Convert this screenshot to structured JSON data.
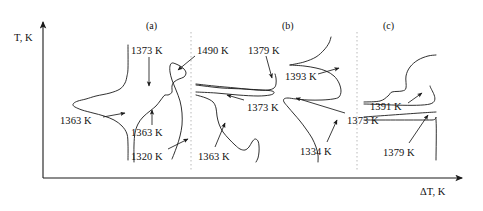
{
  "figure": {
    "background": "#ffffff",
    "ink_color": "#1a1a1a",
    "divider_color": "#b9b9b9",
    "width": 483,
    "height": 211
  },
  "axes": {
    "y_label": "T, K",
    "x_label": "ΔT, K",
    "origin": {
      "x": 43,
      "y": 178
    },
    "y_top": {
      "x": 43,
      "y": 22
    },
    "x_right": {
      "x": 462,
      "y": 178
    }
  },
  "panels": [
    {
      "id": "a",
      "label": "(a)",
      "label_x": 146,
      "label_y": 20
    },
    {
      "id": "b",
      "label": "(b)",
      "label_x": 282,
      "label_y": 20
    },
    {
      "id": "c",
      "label": "(c)",
      "label_x": 383,
      "label_y": 20
    }
  ],
  "dividers": [
    {
      "x": 191,
      "y1": 32,
      "y2": 170,
      "style": "dotted"
    },
    {
      "x": 357,
      "y1": 32,
      "y2": 170,
      "style": "dotted"
    }
  ],
  "annotations": [
    {
      "id": "a-1373",
      "panel": "a",
      "text": "1373 K",
      "x": 131,
      "y": 46,
      "arrow": {
        "x1": 149,
        "y1": 57,
        "x2": 149,
        "y2": 86
      }
    },
    {
      "id": "a-1363-left",
      "panel": "a",
      "text": "1363 K",
      "x": 60,
      "y": 116,
      "arrow": {
        "x1": 103,
        "y1": 117,
        "x2": 125,
        "y2": 113
      }
    },
    {
      "id": "a-1363-mid",
      "panel": "a",
      "text": "1363 K",
      "x": 131,
      "y": 128,
      "arrow": {
        "x1": 152,
        "y1": 125,
        "x2": 152,
        "y2": 110
      }
    },
    {
      "id": "a-1320",
      "panel": "a",
      "text": "1320 K",
      "x": 131,
      "y": 152,
      "arrow": {
        "x1": 168,
        "y1": 149,
        "x2": 188,
        "y2": 139
      }
    },
    {
      "id": "a-1490",
      "panel": "a",
      "text": "1490 K",
      "x": 197,
      "y": 46,
      "arrow": {
        "x1": 195,
        "y1": 56,
        "x2": 178,
        "y2": 70
      }
    },
    {
      "id": "b-1379",
      "panel": "b",
      "text": "1379 K",
      "x": 248,
      "y": 46,
      "arrow": {
        "x1": 266,
        "y1": 56,
        "x2": 272,
        "y2": 78
      }
    },
    {
      "id": "b-1373",
      "panel": "b",
      "text": "1373 K",
      "x": 247,
      "y": 103,
      "arrow": {
        "x1": 244,
        "y1": 100,
        "x2": 227,
        "y2": 95
      }
    },
    {
      "id": "b-1363",
      "panel": "b",
      "text": "1363 K",
      "x": 198,
      "y": 152,
      "arrow": {
        "x1": 215,
        "y1": 147,
        "x2": 225,
        "y2": 123
      }
    },
    {
      "id": "b-1393",
      "panel": "b",
      "text": "1393 K",
      "x": 285,
      "y": 72,
      "arrow": {
        "x1": 318,
        "y1": 74,
        "x2": 339,
        "y2": 68
      }
    },
    {
      "id": "b-1334",
      "panel": "b",
      "text": "1334 K",
      "x": 300,
      "y": 147,
      "arrow": {
        "x1": 327,
        "y1": 142,
        "x2": 337,
        "y2": 120
      }
    },
    {
      "id": "b-1373-right",
      "panel": "b",
      "text": "1373 K",
      "x": 347,
      "y": 116,
      "arrow": {
        "x1": 345,
        "y1": 113,
        "x2": 296,
        "y2": 98
      }
    },
    {
      "id": "c-1391",
      "panel": "c",
      "text": "1391 K",
      "x": 370,
      "y": 102,
      "arrow": {
        "x1": 408,
        "y1": 103,
        "x2": 422,
        "y2": 93
      }
    },
    {
      "id": "c-1379",
      "panel": "c",
      "text": "1379 K",
      "x": 383,
      "y": 148,
      "arrow": {
        "x1": 409,
        "y1": 143,
        "x2": 428,
        "y2": 115
      }
    }
  ],
  "chart_data": {
    "type": "line",
    "title": "",
    "subtitle": "",
    "xlabel": "ΔT, K",
    "ylabel": "T, K",
    "grid": false,
    "legend": "none",
    "note": "Three DTA thermograms (a), (b), (c) with labelled thermal-effect onset temperatures in kelvin.",
    "panels": [
      {
        "name": "(a)",
        "curves": [
          {
            "name": "a-curve-left",
            "points": [
              [
                128,
                45
              ],
              [
                128,
                68
              ],
              [
                127,
                76
              ],
              [
                125,
                83
              ],
              [
                120,
                89
              ],
              [
                110,
                93
              ],
              [
                96,
                96
              ],
              [
                86,
                99
              ],
              [
                78,
                101
              ],
              [
                74,
                103
              ],
              [
                73,
                105
              ],
              [
                75,
                107
              ],
              [
                82,
                110
              ],
              [
                93,
                113
              ],
              [
                104,
                116
              ],
              [
                114,
                120
              ],
              [
                122,
                126
              ],
              [
                127,
                134
              ],
              [
                128,
                145
              ],
              [
                128,
                160
              ]
            ]
          },
          {
            "name": "a-curve-right",
            "points": [
              [
                134,
                162
              ],
              [
                134,
                145
              ],
              [
                135,
                133
              ],
              [
                138,
                124
              ],
              [
                143,
                117
              ],
              [
                150,
                111
              ],
              [
                156,
                106
              ],
              [
                160,
                101
              ],
              [
                163,
                97
              ],
              [
                165,
                95
              ],
              [
                168,
                95
              ],
              [
                170,
                94
              ],
              [
                172,
                92
              ],
              [
                172,
                86
              ],
              [
                174,
                82
              ],
              [
                179,
                79
              ],
              [
                184,
                77
              ],
              [
                186,
                73
              ],
              [
                184,
                69
              ],
              [
                180,
                66
              ],
              [
                176,
                64
              ],
              [
                172,
                63
              ],
              [
                170,
                66
              ],
              [
                170,
                72
              ],
              [
                172,
                80
              ],
              [
                176,
                90
              ],
              [
                180,
                101
              ],
              [
                182,
                113
              ],
              [
                182,
                125
              ],
              [
                180,
                136
              ],
              [
                177,
                146
              ],
              [
                174,
                154
              ],
              [
                172,
                159
              ]
            ]
          }
        ]
      },
      {
        "name": "(b)",
        "curves": [
          {
            "name": "b-curve-left-upper",
            "points": [
              [
                196,
                84
              ],
              [
                214,
                86
              ],
              [
                236,
                88
              ],
              [
                256,
                90
              ],
              [
                268,
                90
              ],
              [
                274,
                88
              ],
              [
                276,
                84
              ],
              [
                276,
                78
              ],
              [
                275,
                74
              ]
            ]
          },
          {
            "name": "b-curve-left-lower",
            "points": [
              [
                196,
                92
              ],
              [
                216,
                93
              ],
              [
                238,
                95
              ],
              [
                258,
                96
              ],
              [
                270,
                95
              ],
              [
                274,
                93
              ],
              [
                272,
                91
              ],
              [
                262,
                90
              ],
              [
                244,
                89
              ],
              [
                222,
                88
              ],
              [
                204,
                86
              ],
              [
                196,
                85
              ]
            ]
          },
          {
            "name": "b-curve-left-tail",
            "points": [
              [
                196,
                95
              ],
              [
                206,
                98
              ],
              [
                213,
                102
              ],
              [
                216,
                108
              ],
              [
                217,
                116
              ],
              [
                219,
                124
              ],
              [
                223,
                132
              ],
              [
                229,
                139
              ],
              [
                235,
                145
              ],
              [
                240,
                149
              ],
              [
                245,
                150
              ],
              [
                249,
                147
              ],
              [
                252,
                142
              ],
              [
                255,
                139
              ],
              [
                258,
                141
              ],
              [
                259,
                146
              ],
              [
                259,
                152
              ],
              [
                258,
                158
              ],
              [
                256,
                162
              ]
            ]
          },
          {
            "name": "b-curve-right",
            "points": [
              [
                290,
                65
              ],
              [
                304,
                66
              ],
              [
                316,
                68
              ],
              [
                326,
                71
              ],
              [
                334,
                76
              ],
              [
                339,
                83
              ],
              [
                341,
                91
              ],
              [
                339,
                97
              ],
              [
                333,
                99
              ],
              [
                322,
                100
              ],
              [
                308,
                100
              ],
              [
                296,
                99
              ],
              [
                288,
                98
              ],
              [
                284,
                99
              ],
              [
                284,
                102
              ],
              [
                288,
                107
              ],
              [
                294,
                114
              ],
              [
                300,
                121
              ],
              [
                306,
                129
              ],
              [
                312,
                138
              ],
              [
                316,
                147
              ],
              [
                318,
                155
              ],
              [
                318,
                162
              ]
            ]
          },
          {
            "name": "b-curve-right-top",
            "points": [
              [
                290,
                65
              ],
              [
                304,
                62
              ],
              [
                316,
                57
              ],
              [
                324,
                50
              ],
              [
                329,
                43
              ],
              [
                331,
                37
              ]
            ]
          }
        ]
      },
      {
        "name": "(c)",
        "curves": [
          {
            "name": "c-curve-upper",
            "points": [
              [
                364,
                102
              ],
              [
                380,
                101
              ],
              [
                388,
                96
              ],
              [
                392,
                92
              ],
              [
                402,
                91
              ],
              [
                406,
                88
              ],
              [
                406,
                76
              ],
              [
                410,
                67
              ],
              [
                418,
                60
              ],
              [
                428,
                56
              ],
              [
                436,
                55
              ]
            ]
          },
          {
            "name": "c-step-box",
            "points": [
              [
                364,
                104
              ],
              [
                430,
                104
              ],
              [
                430,
                86
              ]
            ]
          },
          {
            "name": "c-curve-lower",
            "points": [
              [
                364,
                117
              ],
              [
                392,
                115
              ],
              [
                420,
                113
              ],
              [
                436,
                112
              ]
            ]
          },
          {
            "name": "c-baseline",
            "points": [
              [
                364,
                120
              ],
              [
                400,
                120
              ],
              [
                432,
                120
              ],
              [
                436,
                120
              ],
              [
                436,
                160
              ]
            ]
          }
        ]
      }
    ],
    "labelled_temperatures_K": [
      {
        "panel": "(a)",
        "value": 1373
      },
      {
        "panel": "(a)",
        "value": 1363
      },
      {
        "panel": "(a)",
        "value": 1363
      },
      {
        "panel": "(a)",
        "value": 1320
      },
      {
        "panel": "(a)",
        "value": 1490
      },
      {
        "panel": "(b)",
        "value": 1379
      },
      {
        "panel": "(b)",
        "value": 1373
      },
      {
        "panel": "(b)",
        "value": 1363
      },
      {
        "panel": "(b)",
        "value": 1393
      },
      {
        "panel": "(b)",
        "value": 1334
      },
      {
        "panel": "(b)",
        "value": 1373
      },
      {
        "panel": "(c)",
        "value": 1391
      },
      {
        "panel": "(c)",
        "value": 1379
      }
    ]
  }
}
